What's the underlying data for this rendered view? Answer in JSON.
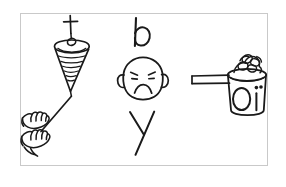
{
  "image": {
    "kind": "line-drawing",
    "style": "hand-drawn black ink on white",
    "width": 286,
    "height": 187,
    "background_color": "#ffffff",
    "ink_color": "#1a1a1a",
    "frame": {
      "border_color": "#c9c9c9",
      "fill_color": "#ffffff",
      "x": 20,
      "y": 13,
      "width": 248,
      "height": 153
    }
  },
  "panels": [
    {
      "id": "panel-left",
      "name": "chalice-with-cross-and-praying-hands",
      "elements": [
        {
          "name": "cross-icon",
          "description": "small latin cross at top of stem"
        },
        {
          "name": "oval-bead",
          "description": "small oval resting in the cup mouth"
        },
        {
          "name": "cup-rim",
          "description": "ellipse forming the mouth of the cone"
        },
        {
          "name": "cone-body",
          "description": "inverted cone with six horizontal rib lines"
        },
        {
          "name": "stem-line",
          "description": "long diagonal line from cone tip down to the hands"
        },
        {
          "name": "praying-hands",
          "description": "two sketched hands with fingers at lower left"
        }
      ]
    },
    {
      "id": "panel-middle",
      "name": "letter-b-sad-face-letter-y",
      "elements": [
        {
          "name": "letter-b-glyph",
          "label": "b",
          "description": "lowercase b drawn above the face"
        },
        {
          "name": "sad-face",
          "description": "round face with angled brows, two eyes, frowning mouth, ears on both sides"
        },
        {
          "name": "left-ear",
          "description": "ear on the left side of the face"
        },
        {
          "name": "right-ear",
          "description": "ear on the right side of the face"
        },
        {
          "name": "letter-y-glyph",
          "label": "y",
          "description": "lowercase y drawn below the face"
        }
      ]
    },
    {
      "id": "panel-right",
      "name": "cooking-pot-with-oi-label",
      "elements": [
        {
          "name": "pot-body",
          "description": "tapered pot body"
        },
        {
          "name": "pot-rim",
          "description": "elliptical rim of the pot"
        },
        {
          "name": "pot-handle",
          "description": "long straight handle extending to the left"
        },
        {
          "name": "bubbles-foam",
          "description": "cluster of bubbles / froth rising from the pot"
        },
        {
          "name": "pot-dot",
          "description": "small filled dot on the upper right of the pot body"
        },
        {
          "name": "pot-label-oi",
          "label": "oi",
          "description": "the letters o and i drawn large on the pot body"
        }
      ]
    }
  ],
  "text_glyphs": {
    "b": "b",
    "y": "y",
    "oi": "oi"
  }
}
